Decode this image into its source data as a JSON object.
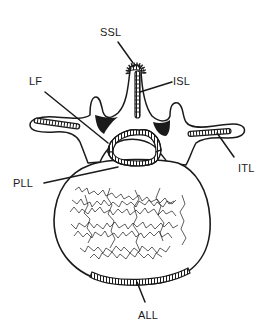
{
  "figure": {
    "colors": {
      "ink": "#1a1a1a",
      "background": "#ffffff",
      "fill_dark": "#1a1a1a"
    },
    "labels": [
      {
        "id": "ssl",
        "text": "SSL",
        "x": 100,
        "y": 27
      },
      {
        "id": "isl",
        "text": "ISL",
        "x": 173,
        "y": 76
      },
      {
        "id": "lf",
        "text": "LF",
        "x": 29,
        "y": 76
      },
      {
        "id": "itl",
        "text": "ITL",
        "x": 238,
        "y": 163
      },
      {
        "id": "pll",
        "text": "PLL",
        "x": 13,
        "y": 178
      },
      {
        "id": "all",
        "text": "ALL",
        "x": 138,
        "y": 310
      }
    ]
  }
}
